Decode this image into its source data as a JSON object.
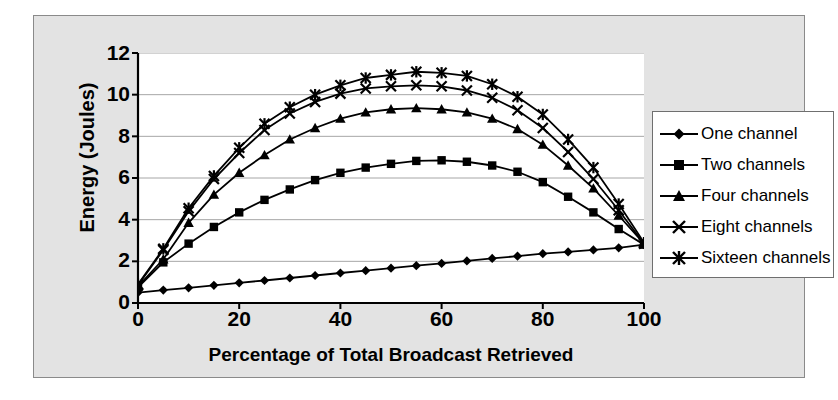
{
  "chart_data": {
    "type": "line",
    "title": "",
    "xlabel": "Percentage of Total Broadcast Retrieved",
    "ylabel": "Energy (Joules)",
    "xlim": [
      0,
      100
    ],
    "ylim": [
      0,
      12
    ],
    "xticks": [
      0,
      20,
      40,
      60,
      80,
      100
    ],
    "yticks": [
      0,
      2,
      4,
      6,
      8,
      10,
      12
    ],
    "grid": "horizontal",
    "legend_position": "right",
    "x": [
      0,
      5,
      10,
      15,
      20,
      25,
      30,
      35,
      40,
      45,
      50,
      55,
      60,
      65,
      70,
      75,
      80,
      85,
      90,
      95,
      100
    ],
    "series": [
      {
        "name": "One channel",
        "marker": "diamond",
        "values": [
          0.5,
          0.62,
          0.73,
          0.85,
          0.97,
          1.08,
          1.2,
          1.32,
          1.44,
          1.55,
          1.67,
          1.79,
          1.9,
          2.02,
          2.14,
          2.25,
          2.37,
          2.45,
          2.55,
          2.65,
          2.8
        ]
      },
      {
        "name": "Two channels",
        "marker": "square",
        "values": [
          0.75,
          1.95,
          2.85,
          3.65,
          4.35,
          4.95,
          5.45,
          5.9,
          6.25,
          6.5,
          6.68,
          6.82,
          6.85,
          6.78,
          6.6,
          6.3,
          5.8,
          5.1,
          4.35,
          3.55,
          2.8
        ]
      },
      {
        "name": "Four channels",
        "marker": "triangle",
        "values": [
          0.8,
          2.1,
          3.85,
          5.2,
          6.25,
          7.1,
          7.85,
          8.4,
          8.85,
          9.15,
          9.3,
          9.35,
          9.3,
          9.15,
          8.85,
          8.35,
          7.6,
          6.6,
          5.5,
          4.2,
          2.85
        ]
      },
      {
        "name": "Eight channels",
        "marker": "x",
        "values": [
          0.85,
          2.55,
          4.4,
          5.95,
          7.2,
          8.3,
          9.1,
          9.65,
          10.05,
          10.3,
          10.4,
          10.45,
          10.4,
          10.2,
          9.85,
          9.25,
          8.4,
          7.25,
          5.95,
          4.45,
          2.85
        ]
      },
      {
        "name": "Sixteen channels",
        "marker": "star",
        "values": [
          0.9,
          2.6,
          4.55,
          6.1,
          7.45,
          8.6,
          9.4,
          10.0,
          10.45,
          10.8,
          10.95,
          11.1,
          11.05,
          10.9,
          10.5,
          9.9,
          9.05,
          7.85,
          6.5,
          4.75,
          2.9
        ]
      }
    ],
    "colors": {
      "series_color": "#000000",
      "plot_background": "#ffffff",
      "chart_background": "#e3e3e3",
      "gridline": "#a6a6a6",
      "axis": "#000000"
    }
  },
  "legend": {
    "items": [
      {
        "label": "One channel"
      },
      {
        "label": "Two channels"
      },
      {
        "label": "Four channels"
      },
      {
        "label": "Eight channels"
      },
      {
        "label": "Sixteen channels"
      }
    ]
  },
  "axes": {
    "y_title": "Energy (Joules)",
    "x_title": "Percentage of Total Broadcast Retrieved",
    "y_labels": [
      "12",
      "10",
      "8",
      "6",
      "4",
      "2",
      "0"
    ],
    "x_labels": [
      "0",
      "20",
      "40",
      "60",
      "80",
      "100"
    ]
  }
}
